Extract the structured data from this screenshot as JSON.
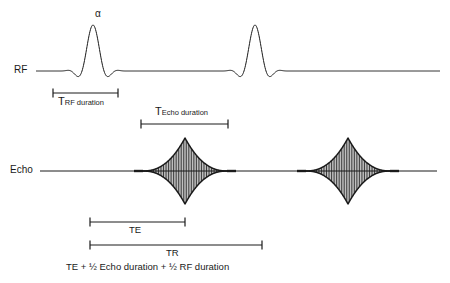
{
  "figure": {
    "type": "mri-pulse-sequence-timing-diagram",
    "background_color": "#ffffff",
    "stroke_color": "#1a1a1a"
  },
  "axes": {
    "rf": {
      "label": "RF",
      "baseline_y": 71
    },
    "echo": {
      "label": "Echo",
      "baseline_y": 171
    }
  },
  "annotations": {
    "flip_angle": {
      "symbol": "α"
    }
  },
  "brackets": [
    {
      "name": "rf-duration",
      "prefix": "T",
      "subscript": "RF duration",
      "x_start": 53,
      "x_end": 118,
      "line_y": 93,
      "label_position": "below"
    },
    {
      "name": "echo-duration",
      "prefix": "T",
      "subscript": "Echo duration",
      "x_start": 141,
      "x_end": 228,
      "line_y": 124,
      "label_position": "above"
    },
    {
      "name": "te",
      "label": "TE",
      "x_start": 90,
      "x_end": 185,
      "line_y": 222,
      "label_position": "below"
    },
    {
      "name": "tr",
      "label": "TR",
      "x_start": 90,
      "x_end": 262,
      "line_y": 245,
      "label_position": "below"
    }
  ],
  "formula": {
    "text": "TE + ½ Echo duration + ½ RF duration"
  },
  "chart_data": {
    "type": "line",
    "title": "",
    "xlabel": "",
    "ylabel": "",
    "grid": false,
    "legend": "none",
    "series": [
      {
        "name": "RF",
        "baseline_y": 71,
        "line_x_start": 36,
        "line_x_end": 440,
        "pulses": [
          {
            "center_x": 93,
            "peak_y": 25,
            "half_width": 33,
            "shape": "sinc",
            "lobes": 3
          },
          {
            "center_x": 255,
            "peak_y": 25,
            "half_width": 33,
            "shape": "sinc",
            "lobes": 3
          }
        ]
      },
      {
        "name": "Echo",
        "baseline_y": 171,
        "line_x_start": 40,
        "line_x_end": 437,
        "echoes": [
          {
            "center_x": 185,
            "half_width": 43,
            "amplitude": 33,
            "shape": "spin-echo-star",
            "oscillations": 26
          },
          {
            "center_x": 348,
            "half_width": 43,
            "amplitude": 33,
            "shape": "spin-echo-star",
            "oscillations": 26
          }
        ]
      }
    ]
  }
}
